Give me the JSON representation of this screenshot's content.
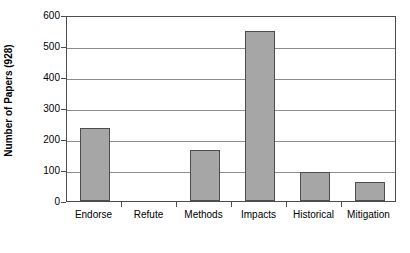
{
  "chart_data": {
    "type": "bar",
    "title": "",
    "subtitle": "",
    "xlabel": "",
    "ylabel": "Number of Papers (928)",
    "categories": [
      "Endorse",
      "Refute",
      "Methods",
      "Impacts",
      "Historical",
      "Mitigation"
    ],
    "values": [
      234,
      0,
      164,
      550,
      95,
      62
    ],
    "series": [
      {
        "name": "Number of Papers",
        "values": [
          234,
          0,
          164,
          550,
          95,
          62
        ]
      }
    ],
    "ylim": [
      0,
      600
    ],
    "yticks": [
      0,
      100,
      200,
      300,
      400,
      500,
      600
    ],
    "ytick_labels": [
      "0",
      "100",
      "200",
      "300",
      "400",
      "500",
      "600"
    ],
    "grid": true,
    "grid_axis": "y",
    "legend": false,
    "legend_position": "none",
    "bar_fill_color": "#a6a6a6",
    "bar_edge_color": "#4d4d4d",
    "gridline_color": "#8c8c8c",
    "axis_color": "#4d4d4d",
    "background_color": "#ffffff",
    "text_color": "#000000",
    "annotations": []
  }
}
